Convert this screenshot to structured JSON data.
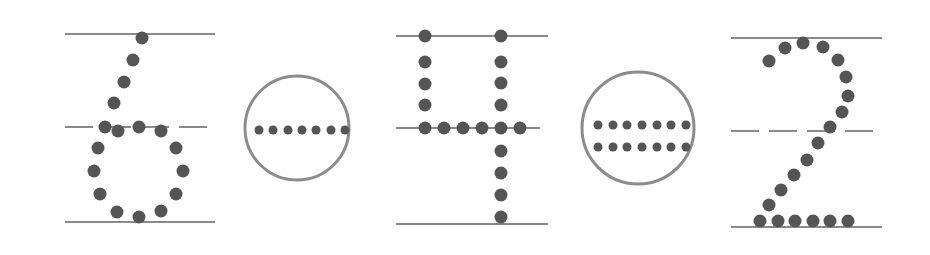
{
  "diagram": {
    "colors": {
      "line": "#8a8a8a",
      "dot": "#555555",
      "circle": "#8c8c8c",
      "background": "#ffffff"
    },
    "items": [
      {
        "type": "digit",
        "value": "6",
        "guides": {
          "top": {
            "x1": 65,
            "x2": 215,
            "y": 34
          },
          "mid": {
            "x1": 65,
            "x2": 208,
            "y": 127,
            "dashed": true
          },
          "bottom": {
            "x1": 65,
            "x2": 215,
            "y": 222
          }
        },
        "dots": [
          [
            142,
            38
          ],
          [
            133,
            60
          ],
          [
            124,
            82
          ],
          [
            114,
            103
          ],
          [
            105,
            127
          ],
          [
            118,
            131
          ],
          [
            139,
            127
          ],
          [
            161,
            131
          ],
          [
            98,
            148
          ],
          [
            176,
            148
          ],
          [
            94,
            171
          ],
          [
            183,
            171
          ],
          [
            100,
            194
          ],
          [
            176,
            194
          ],
          [
            117,
            212
          ],
          [
            139,
            217
          ],
          [
            161,
            211
          ]
        ]
      },
      {
        "type": "operator",
        "value": "minus",
        "circle": {
          "cx": 297,
          "cy": 128,
          "r": 52
        },
        "dots": [
          [
            259,
            130
          ],
          [
            273,
            130
          ],
          [
            288,
            130
          ],
          [
            302,
            130
          ],
          [
            316,
            130
          ],
          [
            331,
            130
          ],
          [
            345,
            130
          ]
        ]
      },
      {
        "type": "digit",
        "value": "4",
        "guides": {
          "top": {
            "x1": 396,
            "x2": 548,
            "y": 36
          },
          "mid": {
            "x1": 396,
            "x2": 540,
            "y": 128,
            "dashed": false
          },
          "bottom": {
            "x1": 396,
            "x2": 548,
            "y": 224
          }
        },
        "dots": [
          [
            425,
            36
          ],
          [
            425,
            62
          ],
          [
            425,
            84
          ],
          [
            425,
            105
          ],
          [
            425,
            128
          ],
          [
            444,
            128
          ],
          [
            463,
            128
          ],
          [
            482,
            128
          ],
          [
            520,
            128
          ],
          [
            501,
            36
          ],
          [
            501,
            62
          ],
          [
            501,
            83
          ],
          [
            501,
            105
          ],
          [
            501,
            128
          ],
          [
            501,
            151
          ],
          [
            501,
            173
          ],
          [
            501,
            195
          ],
          [
            501,
            217
          ]
        ]
      },
      {
        "type": "operator",
        "value": "equals",
        "circle": {
          "cx": 638,
          "cy": 128,
          "r": 56
        },
        "dots": [
          [
            598,
            125
          ],
          [
            613,
            125
          ],
          [
            627,
            125
          ],
          [
            642,
            125
          ],
          [
            657,
            125
          ],
          [
            671,
            125
          ],
          [
            686,
            125
          ],
          [
            598,
            147
          ],
          [
            613,
            147
          ],
          [
            627,
            147
          ],
          [
            642,
            147
          ],
          [
            657,
            147
          ],
          [
            671,
            147
          ],
          [
            686,
            147
          ]
        ]
      },
      {
        "type": "digit",
        "value": "2",
        "guides": {
          "top": {
            "x1": 731,
            "x2": 882,
            "y": 38
          },
          "mid": {
            "x1": 731,
            "x2": 875,
            "y": 131,
            "dashed": true
          },
          "bottom": {
            "x1": 731,
            "x2": 882,
            "y": 227
          }
        },
        "dots": [
          [
            769,
            61
          ],
          [
            785,
            48
          ],
          [
            803,
            43
          ],
          [
            823,
            47
          ],
          [
            838,
            60
          ],
          [
            846,
            77
          ],
          [
            848,
            96
          ],
          [
            842,
            112
          ],
          [
            830,
            127
          ],
          [
            818,
            143
          ],
          [
            807,
            160
          ],
          [
            794,
            175
          ],
          [
            781,
            190
          ],
          [
            769,
            205
          ],
          [
            760,
            221
          ],
          [
            778,
            221
          ],
          [
            795,
            221
          ],
          [
            813,
            221
          ],
          [
            830,
            221
          ],
          [
            848,
            221
          ]
        ]
      }
    ]
  }
}
